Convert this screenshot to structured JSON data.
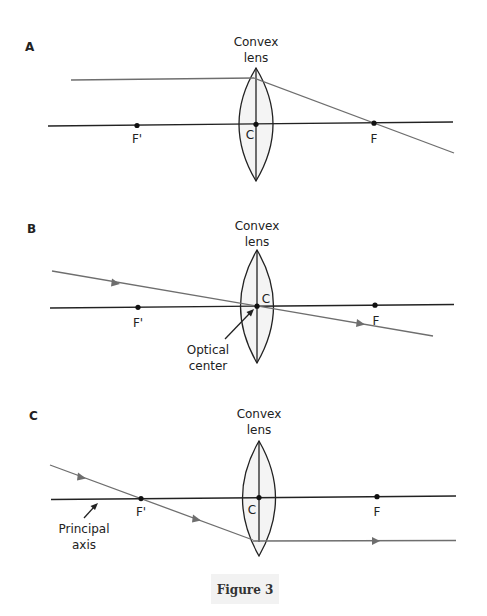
{
  "figure": {
    "caption": "Figure 3",
    "panels": [
      {
        "id": "A",
        "letter": "A",
        "lens_label_line1": "Convex",
        "lens_label_line2": "lens",
        "points": {
          "f_prime": "F'",
          "center": "C",
          "focus": "F"
        },
        "ray_description": "Ray parallel to principal axis refracts through focus F"
      },
      {
        "id": "B",
        "letter": "B",
        "lens_label_line1": "Convex",
        "lens_label_line2": "lens",
        "points": {
          "f_prime": "F'",
          "center": "C",
          "focus": "F"
        },
        "annotation_line1": "Optical",
        "annotation_line2": "center",
        "ray_description": "Ray through optical center passes undeviated"
      },
      {
        "id": "C",
        "letter": "C",
        "lens_label_line1": "Convex",
        "lens_label_line2": "lens",
        "points": {
          "f_prime": "F'",
          "center": "C",
          "focus": "F"
        },
        "annotation_line1": "Principal",
        "annotation_line2": "axis",
        "ray_description": "Ray through F' emerges parallel to principal axis"
      }
    ]
  },
  "colors": {
    "axis": "#222222",
    "ray": "#6e6e6e",
    "lens_fill": "#f4f4f4",
    "caption_bg": "#f2f2f2"
  }
}
